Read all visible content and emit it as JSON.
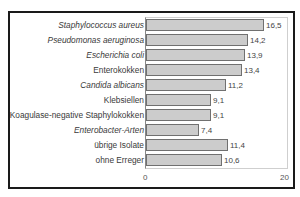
{
  "chart_data": {
    "type": "bar",
    "orientation": "horizontal",
    "title": "",
    "xlabel": "",
    "ylabel": "",
    "categories": [
      "Staphylococcus aureus",
      "Pseudomonas aeruginosa",
      "Escherichia coli",
      "Enterokokken",
      "Candida albicans",
      "Klebsiellen",
      "Koagulase-negative Staphylokokken",
      "Enterobacter-Arten",
      "übrige Isolate",
      "ohne Erreger"
    ],
    "italic": [
      true,
      true,
      true,
      false,
      true,
      false,
      false,
      true,
      false,
      false
    ],
    "values": [
      16.5,
      14.2,
      13.9,
      13.4,
      11.2,
      9.1,
      9.1,
      7.4,
      11.4,
      10.6
    ],
    "value_labels": [
      "16,5",
      "14,2",
      "13,9",
      "13,4",
      "11,2",
      "9,1",
      "9,1",
      "7,4",
      "11,4",
      "10,6"
    ],
    "xlim": [
      0,
      20
    ],
    "xticks": [
      "0",
      "20"
    ],
    "grid": false,
    "legend": null,
    "colors": {
      "bar_fill": "#cccccc",
      "bar_edge": "#707070",
      "frame": "#1a1a1a"
    }
  }
}
